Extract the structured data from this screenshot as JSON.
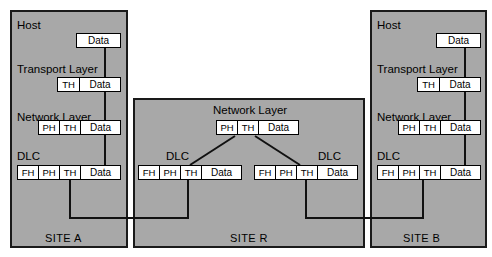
{
  "diagram": {
    "background_color": "#ffffff",
    "panel_color": "#a8a8a8",
    "line_color": "#111111",
    "packet_fill": "#ffffff"
  },
  "sites": [
    {
      "id": "site-a",
      "site_label": "SITE A",
      "layers": [
        {
          "label": "Host"
        },
        {
          "label": "Transport Layer"
        },
        {
          "label": "Network Layer"
        },
        {
          "label": "DLC"
        }
      ],
      "packets": [
        {
          "name": "host-packet",
          "fields": [
            "Data"
          ]
        },
        {
          "name": "transport-packet",
          "fields": [
            "TH",
            "Data"
          ]
        },
        {
          "name": "network-packet",
          "fields": [
            "PH",
            "TH",
            "Data"
          ]
        },
        {
          "name": "dlc-packet",
          "fields": [
            "FH",
            "PH",
            "TH",
            "Data"
          ]
        }
      ]
    },
    {
      "id": "site-r",
      "site_label": "SITE R",
      "layers": [
        {
          "label": "Network Layer"
        },
        {
          "label": "DLC"
        },
        {
          "label": "DLC"
        }
      ],
      "packets": [
        {
          "name": "network-packet",
          "fields": [
            "PH",
            "TH",
            "Data"
          ]
        },
        {
          "name": "dlc-packet-left",
          "fields": [
            "FH",
            "PH",
            "TH",
            "Data"
          ]
        },
        {
          "name": "dlc-packet-right",
          "fields": [
            "FH",
            "PH",
            "TH",
            "Data"
          ]
        }
      ]
    },
    {
      "id": "site-b",
      "site_label": "SITE B",
      "layers": [
        {
          "label": "Host"
        },
        {
          "label": "Transport Layer"
        },
        {
          "label": "Network Layer"
        },
        {
          "label": "DLC"
        }
      ],
      "packets": [
        {
          "name": "host-packet",
          "fields": [
            "Data"
          ]
        },
        {
          "name": "transport-packet",
          "fields": [
            "TH",
            "Data"
          ]
        },
        {
          "name": "network-packet",
          "fields": [
            "PH",
            "TH",
            "Data"
          ]
        },
        {
          "name": "dlc-packet",
          "fields": [
            "FH",
            "PH",
            "TH",
            "Data"
          ]
        }
      ]
    }
  ],
  "field_labels": {
    "data": "Data",
    "th": "TH",
    "ph": "PH",
    "fh": "FH"
  }
}
